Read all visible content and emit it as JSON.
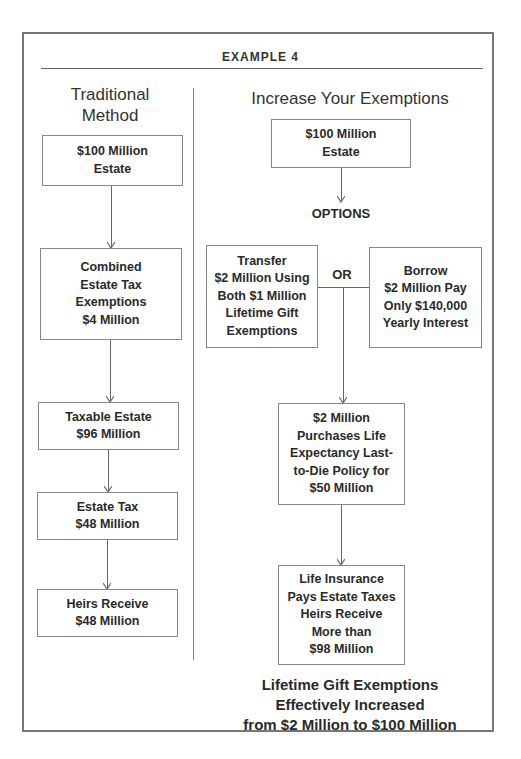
{
  "header": {
    "title": "EXAMPLE 4"
  },
  "left_column": {
    "title": "Traditional\nMethod",
    "title_line1": "Traditional",
    "title_line2": "Method",
    "boxes": [
      {
        "text": "$100 Million\nEstate"
      },
      {
        "text": "Combined\nEstate Tax\nExemptions\n$4 Million"
      },
      {
        "text": "Taxable Estate\n$96 Million"
      },
      {
        "text": "Estate Tax\n$48 Million"
      },
      {
        "text": "Heirs Receive\n$48 Million"
      }
    ]
  },
  "right_column": {
    "title": "Increase Your Exemptions",
    "start_box": {
      "text": "$100 Million\nEstate"
    },
    "options_label": "OPTIONS",
    "or_label": "OR",
    "option_left": {
      "text": "Transfer\n$2 Million Using\nBoth $1 Million\nLifetime Gift\nExemptions"
    },
    "option_right": {
      "text": "Borrow\n$2 Million Pay\nOnly $140,000\nYearly Interest"
    },
    "policy_box": {
      "text": "$2 Million\nPurchases Life\nExpectancy Last-\nto-Die Policy for\n$50 Million"
    },
    "result_box": {
      "text": "Life Insurance\nPays Estate Taxes\nHeirs Receive\nMore than\n$98 Million"
    },
    "conclusion": "Lifetime Gift Exemptions\nEffectively Increased\nfrom $2 Million to $100 Million"
  },
  "colors": {
    "border": "#777777",
    "text": "#2a2a2a",
    "line": "#666666"
  }
}
